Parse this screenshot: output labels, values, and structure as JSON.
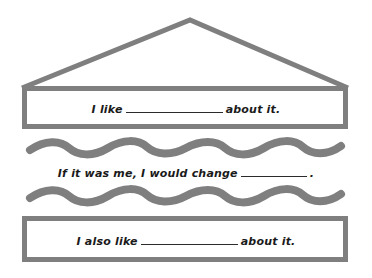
{
  "worksheet": {
    "type": "house-graphic-organizer",
    "colors": {
      "outline": "#7f7f7f",
      "text": "#1a1a1a",
      "background": "#ffffff",
      "blank_line": "#2b2b2b"
    },
    "shapes": {
      "roof": {
        "name": "triangle-roof",
        "apex_x": 190,
        "apex_y": 20,
        "left_x": 22,
        "right_x": 348,
        "base_y": 88,
        "stroke_width": 5
      },
      "top_box": {
        "name": "rectangle",
        "x": 22,
        "y": 86,
        "width": 326,
        "height": 42,
        "stroke_width": 5
      },
      "wave_top": {
        "name": "wavy-line",
        "x_start": 30,
        "x_end": 341,
        "y": 148,
        "stroke_width": 8,
        "amplitude": 6,
        "period": 78
      },
      "wave_bottom": {
        "name": "wavy-line",
        "x_start": 30,
        "x_end": 341,
        "y": 196,
        "stroke_width": 8,
        "amplitude": 6,
        "period": 78
      },
      "bottom_box": {
        "name": "rectangle",
        "x": 22,
        "y": 216,
        "width": 326,
        "height": 46,
        "stroke_width": 5
      }
    },
    "prompts": {
      "top": {
        "id": "prompt-top",
        "lead": "I like",
        "blank": "____________",
        "trail": "about it."
      },
      "middle": {
        "id": "prompt-middle",
        "lead": "If it was me, I would change",
        "blank": "_________",
        "trail": "."
      },
      "bottom": {
        "id": "prompt-bottom",
        "lead": "I also like",
        "blank": "____________",
        "trail": "about it."
      }
    }
  }
}
